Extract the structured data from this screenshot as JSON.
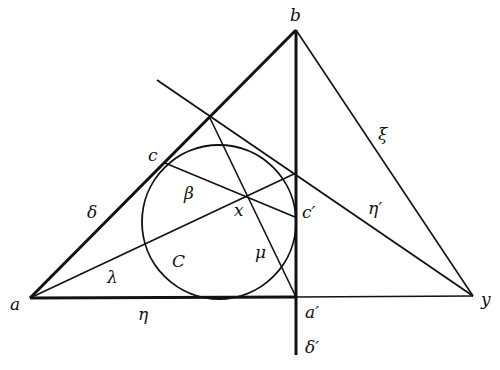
{
  "diagram": {
    "points": {
      "a": {
        "label": "a",
        "x": 30,
        "y": 298
      },
      "b": {
        "label": "b",
        "x": 296,
        "y": 30
      },
      "y": {
        "label": "y",
        "x": 473,
        "y": 296
      },
      "a_prime": {
        "label": "a′",
        "x": 296,
        "y": 297
      },
      "c": {
        "label": "c",
        "x": 165,
        "y": 163
      },
      "c_prime": {
        "label": "c′",
        "x": 295,
        "y": 217
      },
      "x": {
        "label": "x",
        "x": 246,
        "y": 196
      }
    },
    "circle": {
      "label": "C",
      "cx": 219,
      "cy": 222,
      "r": 77
    },
    "line_labels": {
      "delta": "δ",
      "delta_prime": "δ′",
      "eta": "η",
      "eta_prime": "η′",
      "xi": "ξ",
      "lambda": "λ",
      "beta": "β",
      "mu": "μ"
    },
    "stroke_color": "#111111"
  }
}
